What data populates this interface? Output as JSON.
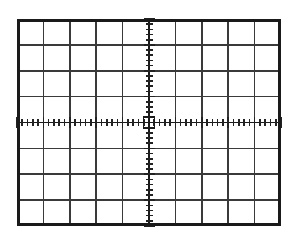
{
  "figure": {
    "name": "oscilloscope-graticule",
    "title": "",
    "caption": "",
    "background_color": "#ffffff"
  },
  "graticule": {
    "label": "CRT graticule",
    "frame": {
      "x": 17,
      "y": 19,
      "width": 264,
      "height": 207,
      "stroke_color": "#1a1a1a",
      "stroke_width": 3,
      "fill_color": "#ffffff"
    },
    "divisions": {
      "horizontal_count": 10,
      "vertical_count": 8,
      "cell_width": 26.4,
      "cell_height": 25.875,
      "grid_line_color": "#3a3a3a",
      "grid_line_width": 1.6
    },
    "axes": {
      "horizontal_axis_y": 122.5,
      "vertical_axis_x": 149,
      "axis_color": "#1a1a1a",
      "axis_width": 1.8
    },
    "minor_ticks": {
      "per_division": 5,
      "subdivision_spacing_x": 5.28,
      "subdivision_spacing_y": 5.175,
      "tick_length_short": 7,
      "tick_length_long": 11,
      "tick_color": "#222222",
      "tick_width": 1.6
    },
    "center_marker": {
      "shape": "square",
      "size": 11,
      "stroke_color": "#1a1a1a",
      "stroke_width": 1.8
    }
  },
  "chart_data": {
    "type": "grid",
    "xlabel": "",
    "ylabel": "",
    "x_divisions": 10,
    "y_divisions": 8,
    "minor_ticks_per_division": 5,
    "xlim": [
      -5,
      5
    ],
    "ylim": [
      -4,
      4
    ],
    "grid": true,
    "legend": "none",
    "series": [],
    "annotations": [
      "Center origin marked with small square",
      "Minor tick marks along horizontal center axis",
      "Minor tick marks along vertical center axis"
    ]
  }
}
